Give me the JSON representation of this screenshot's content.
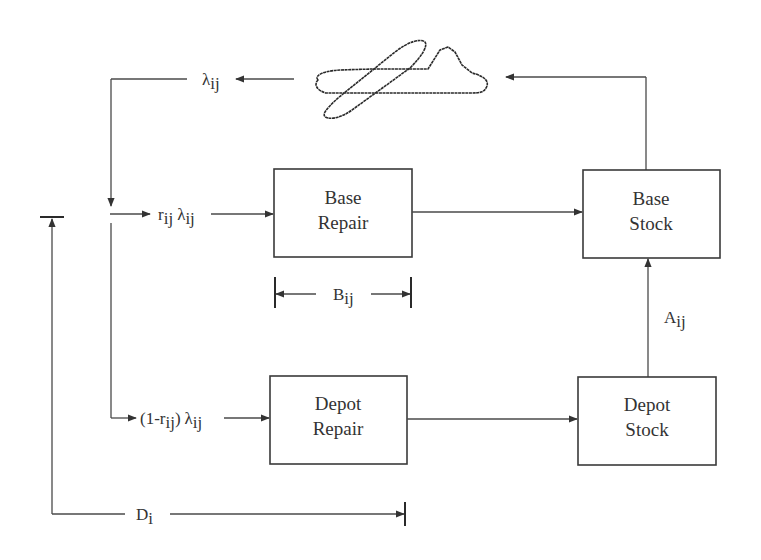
{
  "diagram": {
    "colors": {
      "line": "#4a4a4a",
      "box_border": "#3a3a3a",
      "text": "#333333",
      "background": "#ffffff"
    },
    "icons": {
      "aircraft": "airplane-outline-icon"
    },
    "boxes": {
      "base_repair": {
        "line1": "Base",
        "line2": "Repair"
      },
      "base_stock": {
        "line1": "Base",
        "line2": "Stock"
      },
      "depot_repair": {
        "line1": "Depot",
        "line2": "Repair"
      },
      "depot_stock": {
        "line1": "Depot",
        "line2": "Stock"
      }
    },
    "labels": {
      "failure_rate": {
        "symbol": "λ",
        "sub": "ij"
      },
      "base_flow": {
        "r": "r",
        "r_sub": "ij",
        "symbol": "λ",
        "sub": "ij"
      },
      "depot_flow": {
        "open": "(1-r",
        "r_sub": "ij",
        "close": ")",
        "symbol": "λ",
        "sub": "ij"
      },
      "base_repair_time": {
        "symbol": "B",
        "sub": "ij"
      },
      "depot_resupply": {
        "symbol": "A",
        "sub": "ij"
      },
      "depot_delay": {
        "symbol": "D",
        "sub": "i"
      }
    }
  }
}
